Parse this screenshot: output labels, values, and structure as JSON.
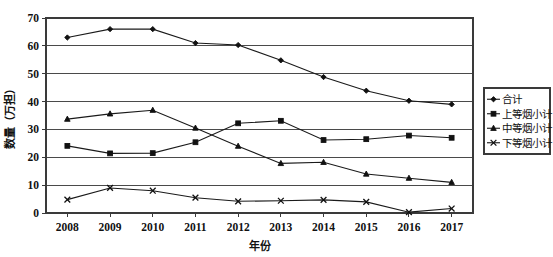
{
  "chart_data": {
    "type": "line",
    "title": "",
    "xlabel": "年份",
    "ylabel": "数量（万担）",
    "categories": [
      "2008",
      "2009",
      "2010",
      "2011",
      "2012",
      "2013",
      "2014",
      "2015",
      "2016",
      "2017"
    ],
    "ylim": [
      0,
      70
    ],
    "ytick_step": 10,
    "yticks": [
      "0",
      "10",
      "20",
      "30",
      "40",
      "50",
      "60",
      "70"
    ],
    "grid": "horizontal",
    "legend_position": "right-outside",
    "series": [
      {
        "name": "合计",
        "marker": "diamond",
        "values": [
          63.0,
          66.0,
          66.0,
          61.0,
          60.3,
          54.8,
          48.8,
          43.9,
          40.3,
          39.0
        ]
      },
      {
        "name": "上等烟小计",
        "marker": "square",
        "values": [
          24.1,
          21.4,
          21.5,
          25.4,
          32.2,
          33.1,
          26.2,
          26.5,
          27.8,
          27.0
        ]
      },
      {
        "name": "中等烟小计",
        "marker": "triangle",
        "values": [
          33.7,
          35.6,
          36.9,
          30.5,
          24.0,
          17.8,
          18.2,
          14.0,
          12.5,
          11.0
        ]
      },
      {
        "name": "下等烟小计",
        "marker": "cross",
        "values": [
          4.8,
          9.0,
          8.0,
          5.5,
          4.2,
          4.4,
          4.7,
          4.0,
          0.3,
          1.6
        ]
      }
    ]
  },
  "colors": {
    "line": "#111111",
    "grid": "#4a4a4a",
    "frame": "#3a3a3a",
    "background": "#ffffff"
  }
}
